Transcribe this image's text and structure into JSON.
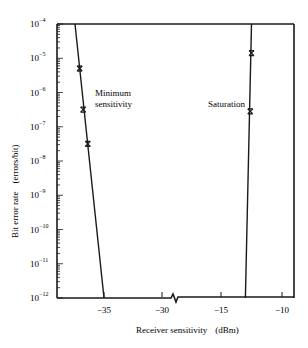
{
  "chart_data": {
    "type": "line",
    "title": "",
    "xlabel": "Receiver sensitivity (dBm)",
    "ylabel": "Bit error rate (errors/bit)",
    "xlabel_parts": {
      "main": "Receiver sensitivity",
      "unit": "(dBm)"
    },
    "ylabel_parts": {
      "main": "Bit error rate",
      "unit": "(errors/bit)"
    },
    "yscale": "log",
    "ylim": [
      1e-12,
      0.0001
    ],
    "xlim": [
      -39,
      -9
    ],
    "x_axis_break": {
      "between": [
        -30,
        -15
      ]
    },
    "x_ticks": [
      -35,
      -30,
      -15,
      -10
    ],
    "x_tick_labels": [
      "−35",
      "−30",
      "−15",
      "−10"
    ],
    "y_ticks": [
      -4,
      -5,
      -6,
      -7,
      -8,
      -9,
      -10,
      -11,
      -12
    ],
    "y_tick_labels": [
      "10",
      "10",
      "10",
      "10",
      "10",
      "10",
      "10",
      "10",
      "10"
    ],
    "y_tick_exponents": [
      "−4",
      "−5",
      "−6",
      "−7",
      "−8",
      "−9",
      "−10",
      "−11",
      "−12"
    ],
    "grid": false,
    "legend": null,
    "series": [
      {
        "name": "Minimum sensitivity",
        "line": [
          {
            "x": -37.5,
            "log10_ber": -4
          },
          {
            "x": -35.0,
            "log10_ber": -12
          }
        ],
        "markers": [
          {
            "x": -37.1,
            "log10_ber": -5.3
          },
          {
            "x": -36.8,
            "log10_ber": -6.5
          },
          {
            "x": -36.4,
            "log10_ber": -7.5
          }
        ]
      },
      {
        "name": "Saturation",
        "line": [
          {
            "x": -12.5,
            "log10_ber": -4
          },
          {
            "x": -13.0,
            "log10_ber": -12
          }
        ],
        "markers": [
          {
            "x": -12.5,
            "log10_ber": -4.85
          },
          {
            "x": -12.6,
            "log10_ber": -6.55
          }
        ]
      }
    ],
    "annotations": [
      {
        "text_line1": "Minimum",
        "text_line2": "sensitivity"
      },
      {
        "text": "Saturation"
      }
    ]
  }
}
